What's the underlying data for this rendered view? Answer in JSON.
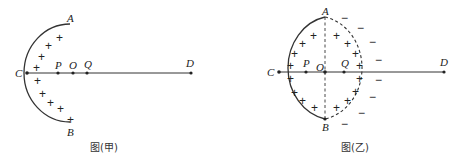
{
  "figures": [
    {
      "caption": "图(甲)",
      "description": "Uniformly positively charged hemispherical shell ACB with axis through C, P, O, Q to D",
      "labels": {
        "A": "A",
        "B": "B",
        "C": "C",
        "D": "D",
        "P": "P",
        "O": "O",
        "Q": "Q"
      },
      "charge_sign": "+",
      "plus_count": 10
    },
    {
      "caption": "图(乙)",
      "description": "Positively charged hemisphere completed with a dashed hemisphere into a full sphere, dashed diameter AB, negative charges outside right half",
      "labels": {
        "A": "A",
        "B": "B",
        "C": "C",
        "D": "D",
        "P": "P",
        "O": "O",
        "Q": "Q"
      },
      "charge_sign_inside": "+",
      "charge_sign_outside": "−",
      "plus_count": 18,
      "minus_count": 10
    }
  ],
  "colors": {
    "stroke": "#333333",
    "text": "#222222",
    "background": "#ffffff"
  }
}
